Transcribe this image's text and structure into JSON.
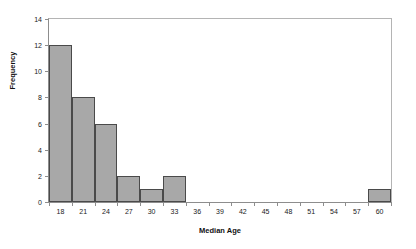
{
  "chart_data": {
    "type": "bar",
    "title": "",
    "xlabel": "Median Age",
    "ylabel": "Frequency",
    "categories": [
      "18",
      "21",
      "24",
      "27",
      "30",
      "33",
      "36",
      "39",
      "42",
      "45",
      "48",
      "51",
      "54",
      "57",
      "60"
    ],
    "values": [
      12,
      8,
      6,
      2,
      1,
      2,
      0,
      0,
      0,
      0,
      0,
      0,
      0,
      0,
      1
    ],
    "ylim": [
      0,
      14
    ],
    "yticks": [
      "0",
      "2",
      "4",
      "6",
      "8",
      "10",
      "12",
      "14"
    ],
    "ytick_values": [
      0,
      2,
      4,
      6,
      8,
      10,
      12,
      14
    ],
    "grid": false,
    "legend": false,
    "bar_fill_color": "#a8a8a8",
    "bar_border_color": "#4a4a4a",
    "axis_color": "#8d8d8d",
    "background_color": "#ffffff"
  }
}
